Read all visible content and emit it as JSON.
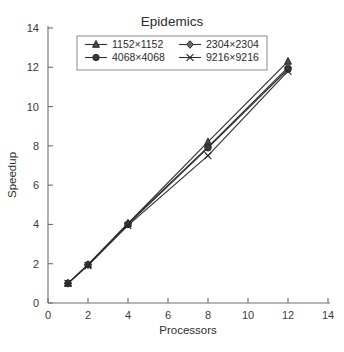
{
  "chart_data": {
    "type": "line",
    "title": "Epidemics",
    "xlabel": "Processors",
    "ylabel": "Speedup",
    "xlim": [
      0,
      14
    ],
    "ylim": [
      0,
      14
    ],
    "xticks": [
      0,
      2,
      4,
      6,
      8,
      10,
      12,
      14
    ],
    "yticks": [
      0,
      2,
      4,
      6,
      8,
      10,
      12,
      14
    ],
    "grid": false,
    "legend_position": "top-center",
    "x": [
      1,
      2,
      4,
      8,
      12
    ],
    "series": [
      {
        "name": "1152×1152",
        "marker": "triangle",
        "values": [
          1.0,
          1.95,
          4.05,
          8.2,
          12.3
        ]
      },
      {
        "name": "2304×2304",
        "marker": "diamond",
        "values": [
          1.0,
          1.95,
          4.05,
          7.95,
          12.0
        ]
      },
      {
        "name": "4068×4068",
        "marker": "circle",
        "values": [
          1.0,
          1.95,
          4.0,
          7.9,
          11.9
        ]
      },
      {
        "name": "9216×9216",
        "marker": "cross",
        "values": [
          1.0,
          1.9,
          3.95,
          7.5,
          11.8
        ]
      }
    ]
  },
  "axes": {
    "x_title": "Processors",
    "y_title": "Speedup",
    "x_tick_labels": [
      "0",
      "2",
      "4",
      "6",
      "8",
      "10",
      "12",
      "14"
    ],
    "y_tick_labels": [
      "0",
      "2",
      "4",
      "6",
      "8",
      "10",
      "12",
      "14"
    ]
  },
  "legend": {
    "entries": [
      {
        "label": "1152×1152",
        "marker": "triangle-marker"
      },
      {
        "label": "2304×2304",
        "marker": "diamond-marker"
      },
      {
        "label": "4068×4068",
        "marker": "circle-marker"
      },
      {
        "label": "9216×9216",
        "marker": "cross-marker"
      }
    ]
  },
  "colors": {
    "line": "#2f2f2f",
    "axis": "#6f6f6f",
    "text": "#2b2b2b",
    "background": "#ffffff"
  }
}
